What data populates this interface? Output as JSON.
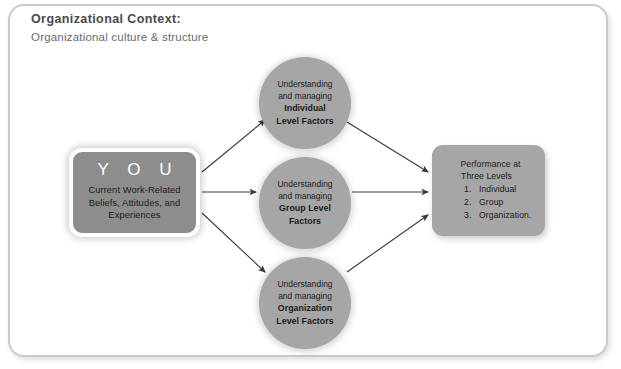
{
  "header": {
    "title": "Organizational Context:",
    "subtitle": "Organizational culture & structure"
  },
  "you_box": {
    "title": "Y O U",
    "description_lines": [
      "Current Work-Related",
      "Beliefs, Attitudes, and",
      "Experiences"
    ],
    "fill_color": "#8d8d8d",
    "title_color": "#ffffff"
  },
  "circles": [
    {
      "id": "individual",
      "lines": [
        "Understanding",
        "and managing"
      ],
      "bold_lines": [
        "Individual",
        "Level Factors"
      ],
      "fill_color": "#a6a6a6"
    },
    {
      "id": "group",
      "lines": [
        "Understanding",
        "and managing"
      ],
      "bold_lines": [
        "Group Level",
        "Factors"
      ],
      "fill_color": "#a6a6a6"
    },
    {
      "id": "organization",
      "lines": [
        "Understanding",
        "and managing"
      ],
      "bold_lines": [
        "Organization",
        "Level Factors"
      ],
      "fill_color": "#a6a6a6"
    }
  ],
  "performance_box": {
    "title_line1": "Performance at",
    "title_line2": "Three Levels",
    "items": [
      {
        "number": "1.",
        "label": "Individual"
      },
      {
        "number": "2.",
        "label": "Group"
      },
      {
        "number": "3.",
        "label": "Organization."
      }
    ],
    "fill_color": "#a6a6a6"
  },
  "frame": {
    "border_color": "#c9c9c9",
    "background_color": "#ffffff"
  },
  "arrows": {
    "color": "#3a3a3a",
    "count": 6
  }
}
